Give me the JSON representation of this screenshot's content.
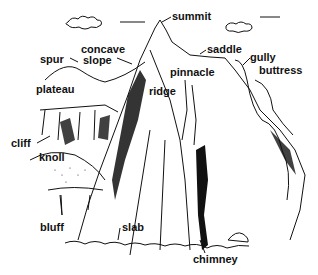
{
  "diagram": {
    "labels": [
      {
        "id": "summit",
        "text": "summit",
        "x": 172,
        "y": 11
      },
      {
        "id": "concave-slope-1",
        "text": "concave",
        "x": 81,
        "y": 44
      },
      {
        "id": "concave-slope-2",
        "text": "slope",
        "x": 83,
        "y": 55
      },
      {
        "id": "spur",
        "text": "spur",
        "x": 40,
        "y": 54
      },
      {
        "id": "saddle",
        "text": "saddle",
        "x": 207,
        "y": 44
      },
      {
        "id": "gully",
        "text": "gully",
        "x": 250,
        "y": 52
      },
      {
        "id": "buttress",
        "text": "buttress",
        "x": 259,
        "y": 65
      },
      {
        "id": "pinnacle",
        "text": "pinnacle",
        "x": 170,
        "y": 67
      },
      {
        "id": "plateau",
        "text": "plateau",
        "x": 36,
        "y": 84
      },
      {
        "id": "ridge",
        "text": "ridge",
        "x": 149,
        "y": 86
      },
      {
        "id": "cliff",
        "text": "cliff",
        "x": 11,
        "y": 138
      },
      {
        "id": "knoll",
        "text": "knoll",
        "x": 39,
        "y": 152
      },
      {
        "id": "bluff",
        "text": "bluff",
        "x": 40,
        "y": 222
      },
      {
        "id": "slab",
        "text": "slab",
        "x": 122,
        "y": 222
      },
      {
        "id": "chimney",
        "text": "chimney",
        "x": 193,
        "y": 254
      }
    ]
  }
}
